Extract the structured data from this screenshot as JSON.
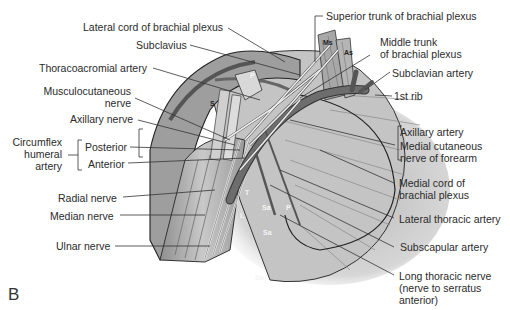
{
  "figure": {
    "panel_label": "B",
    "labels_left": {
      "lateral_cord": "Lateral cord of brachial plexus",
      "subclavius": "Subclavius",
      "thoracoacromial": "Thoracoacromial artery",
      "musculocutaneous_1": "Musculocutaneous",
      "musculocutaneous_2": "nerve",
      "axillary_nerve": "Axillary nerve",
      "circumflex_1": "Circumflex",
      "circumflex_2": "humeral",
      "circumflex_3": "artery",
      "posterior": "Posterior",
      "anterior": "Anterior",
      "radial": "Radial nerve",
      "median": "Median nerve",
      "ulnar": "Ulnar nerve"
    },
    "labels_right": {
      "superior_trunk": "Superior trunk of brachial plexus",
      "middle_trunk_1": "Middle trunk",
      "middle_trunk_2": "of brachial plexus",
      "subclavian": "Subclavian artery",
      "first_rib": "1st rib",
      "axillary_artery": "Axillary artery",
      "medial_cutaneous_1": "Medial cutaneous",
      "medial_cutaneous_2": "nerve of forearm",
      "medial_cord_1": "Medial cord of",
      "medial_cord_2": "brachial plexus",
      "lateral_thoracic": "Lateral thoracic artery",
      "subscapular": "Subscapular artery",
      "long_thoracic_1": "Long thoracic nerve",
      "long_thoracic_2": "(nerve to serratus",
      "long_thoracic_3": "anterior)"
    },
    "embedded": {
      "ms": "Ms",
      "as": "As",
      "s": "S",
      "p_top": "P",
      "t": "T",
      "l": "L",
      "sa1": "Sa",
      "p_mid": "P",
      "sa2": "Sa",
      "sa3": "Sa"
    }
  }
}
